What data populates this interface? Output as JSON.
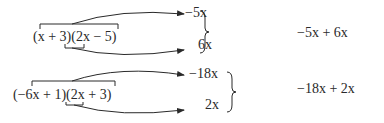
{
  "examples": [
    {
      "product": "(x + 3)(2x − 5)",
      "outer_term": "−5x",
      "inner_term": "6x",
      "sum": "−5x + 6x"
    },
    {
      "product": "(−6x + 1)(2x + 3)",
      "outer_term": "−18x",
      "inner_term": "2x",
      "sum": "−18x + 2x"
    }
  ]
}
